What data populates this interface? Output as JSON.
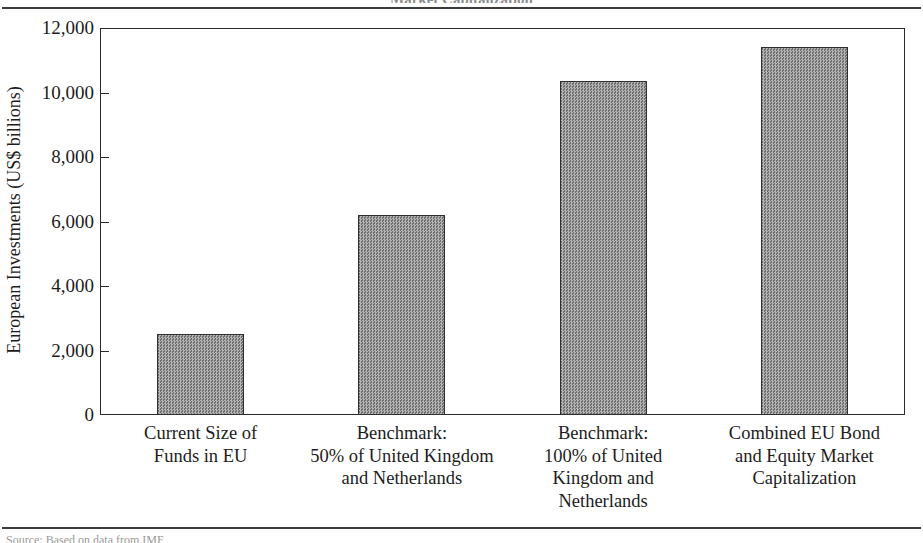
{
  "figure": {
    "caption_top_partial": "Market Capitalization",
    "source_partial": "Source:  Based on data from IMF,"
  },
  "chart_data": {
    "type": "bar",
    "title": "",
    "xlabel": "",
    "ylabel": "European Investments (US$ billions)",
    "categories": [
      "Current Size of\nFunds in EU",
      "Benchmark:\n50% of United Kingdom\nand Netherlands",
      "Benchmark:\n100% of United\nKingdom and\nNetherlands",
      "Combined EU Bond\nand Equity Market\nCapitalization"
    ],
    "category_lines": [
      [
        "Current Size of",
        "Funds in EU"
      ],
      [
        "Benchmark:",
        "50% of United Kingdom",
        "and Netherlands"
      ],
      [
        "Benchmark:",
        "100% of United",
        "Kingdom and",
        "Netherlands"
      ],
      [
        "Combined EU Bond",
        "and Equity Market",
        "Capitalization"
      ]
    ],
    "values": [
      2500,
      6200,
      10350,
      11400
    ],
    "ylim": [
      0,
      12000
    ],
    "ytick_values": [
      0,
      2000,
      4000,
      6000,
      8000,
      10000,
      12000
    ],
    "ytick_labels": [
      "0",
      "2,000",
      "4,000",
      "6,000",
      "8,000",
      "10,000",
      "12,000"
    ],
    "grid": false,
    "legend": "none",
    "bar_color": "#969696",
    "bar_edge_color": "#2f2f2f",
    "axis_color": "#2a2a2a"
  }
}
